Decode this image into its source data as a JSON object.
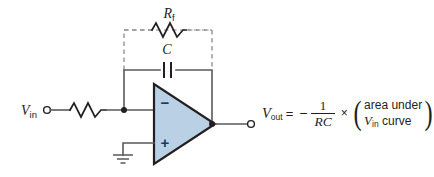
{
  "diagram": {
    "colors": {
      "opamp_fill": "#b9d0e5",
      "opamp_stroke": "#231f20",
      "wire": "#58595b",
      "dashed_box": "#808285",
      "background": "#ffffff"
    },
    "components": {
      "input_resistor": {
        "label": "R",
        "name": "resistor-R"
      },
      "feedback_resistor": {
        "label": "R",
        "subscript": "f",
        "name": "resistor-Rf",
        "style": "optional-dashed"
      },
      "feedback_capacitor": {
        "label": "C",
        "name": "capacitor-C"
      },
      "opamp": {
        "inverting_input_sign": "−",
        "noninverting_input_sign": "+",
        "name": "operational-amplifier"
      },
      "ground": {
        "name": "ground-symbol"
      }
    },
    "terminals": {
      "input": {
        "label": "V",
        "subscript": "in"
      },
      "output": {
        "label": "V",
        "subscript": "out"
      }
    },
    "equation": {
      "lhs_var": "V",
      "lhs_sub": "out",
      "equals": "=",
      "minus": "−",
      "numerator": "1",
      "denominator": "RC",
      "times": "×",
      "paren_open": "(",
      "paren_close": ")",
      "paren_line1": "area under",
      "paren_line2_var": "V",
      "paren_line2_sub": "in",
      "paren_line2_rest": " curve"
    }
  }
}
